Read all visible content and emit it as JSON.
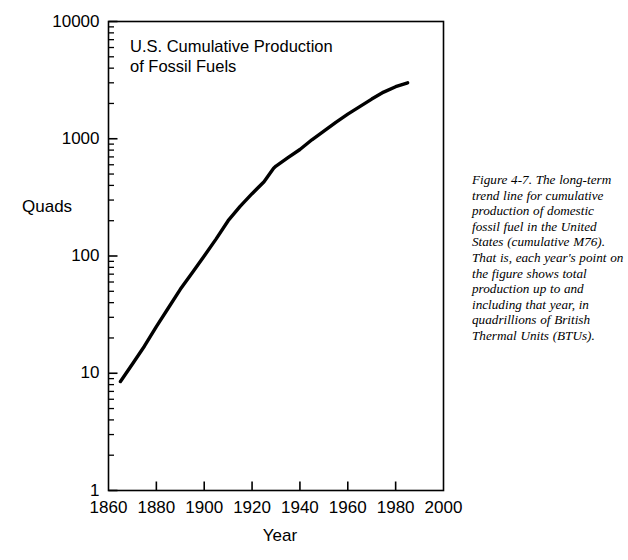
{
  "figure": {
    "caption": "Figure 4-7. The long-term trend line for cumulative production of domestic fossil fuel in the United States (cumulative M76). That is, each year's point on the figure shows total production up to and including that year, in quadrillions of British Thermal Units (BTUs)."
  },
  "chart_data": {
    "type": "line",
    "title": "U.S. Cumulative Production\nof Fossil Fuels",
    "xlabel": "Year",
    "ylabel": "Quads",
    "xscale": "linear",
    "yscale": "log",
    "xlim": [
      1860,
      2000
    ],
    "ylim": [
      1,
      10000
    ],
    "grid": false,
    "legend": null,
    "line_color": "#000000",
    "axis_color": "#000000",
    "background_color": "#ffffff",
    "xticks": [
      1860,
      1880,
      1900,
      1920,
      1940,
      1960,
      1980,
      2000
    ],
    "xtick_labels": [
      "1860",
      "1880",
      "1900",
      "1920",
      "1940",
      "1960",
      "1980",
      "2000"
    ],
    "yticks": [
      1,
      10,
      100,
      1000,
      10000
    ],
    "ytick_labels": [
      "1",
      "10",
      "100",
      "1000",
      "10000"
    ],
    "x": [
      1865,
      1870,
      1875,
      1880,
      1885,
      1890,
      1895,
      1900,
      1905,
      1910,
      1915,
      1920,
      1925,
      1929,
      1930,
      1935,
      1940,
      1945,
      1950,
      1955,
      1960,
      1965,
      1970,
      1975,
      1980,
      1985
    ],
    "values": [
      8.5,
      12,
      17,
      25,
      36,
      52,
      72,
      100,
      140,
      200,
      265,
      340,
      430,
      560,
      585,
      690,
      810,
      980,
      1160,
      1380,
      1620,
      1880,
      2180,
      2500,
      2780,
      3000
    ],
    "series": [
      {
        "name": "U.S. cumulative fossil fuel production",
        "units": "Quads",
        "x": [
          1865,
          1870,
          1875,
          1880,
          1885,
          1890,
          1895,
          1900,
          1905,
          1910,
          1915,
          1920,
          1925,
          1929,
          1930,
          1935,
          1940,
          1945,
          1950,
          1955,
          1960,
          1965,
          1970,
          1975,
          1980,
          1985
        ],
        "values": [
          8.5,
          12,
          17,
          25,
          36,
          52,
          72,
          100,
          140,
          200,
          265,
          340,
          430,
          560,
          585,
          690,
          810,
          980,
          1160,
          1380,
          1620,
          1880,
          2180,
          2500,
          2780,
          3000
        ]
      }
    ]
  }
}
